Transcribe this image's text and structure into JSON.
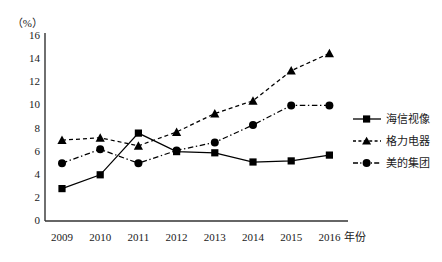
{
  "top_fragment": "  ",
  "axes": {
    "y_unit_label": "（%）",
    "y_ticks": [
      "16",
      "14",
      "12",
      "10",
      "8",
      "6",
      "4",
      "2",
      "0"
    ],
    "x_unit_label": "年份"
  },
  "legend": {
    "items": [
      {
        "label": "海信视像",
        "marker": "square",
        "line": "solid",
        "color": "#000000"
      },
      {
        "label": "格力电器",
        "marker": "triangle",
        "line": "dashed",
        "color": "#000000"
      },
      {
        "label": "美的集团",
        "marker": "circle",
        "line": "dashdot",
        "color": "#000000"
      }
    ]
  },
  "chart_data": {
    "type": "line",
    "title": "",
    "xlabel": "年份",
    "ylabel": "（%）",
    "ylim": [
      0,
      16
    ],
    "ytick_step": 2,
    "grid": false,
    "legend_position": "right",
    "categories": [
      "2009",
      "2010",
      "2011",
      "2012",
      "2013",
      "2014",
      "2015",
      "2016"
    ],
    "series": [
      {
        "name": "海信视像",
        "marker": "square",
        "linestyle": "solid",
        "values": [
          2.8,
          4.0,
          7.6,
          6.0,
          5.9,
          5.1,
          5.2,
          5.7
        ]
      },
      {
        "name": "格力电器",
        "marker": "triangle",
        "linestyle": "dashed",
        "values": [
          7.0,
          7.2,
          6.5,
          7.7,
          9.3,
          10.4,
          13.0,
          14.5
        ]
      },
      {
        "name": "美的集团",
        "marker": "circle",
        "linestyle": "dashdot",
        "values": [
          5.0,
          6.2,
          5.0,
          6.1,
          6.8,
          8.3,
          10.0,
          10.0
        ]
      }
    ]
  }
}
